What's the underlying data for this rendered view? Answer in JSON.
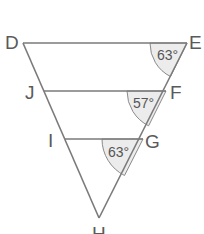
{
  "diagram": {
    "type": "geometry-figure",
    "colors": {
      "line": "#7a7a7a",
      "label": "#5a5a5a",
      "angle_fill": "#ececec"
    },
    "vertices": [
      {
        "name": "D",
        "label": "D"
      },
      {
        "name": "E",
        "label": "E"
      },
      {
        "name": "J",
        "label": "J"
      },
      {
        "name": "F",
        "label": "F"
      },
      {
        "name": "I",
        "label": "I"
      },
      {
        "name": "G",
        "label": "G"
      },
      {
        "name": "H",
        "label": "H"
      }
    ],
    "segments": [
      "DE",
      "JF",
      "IG",
      "DH",
      "EH"
    ],
    "angles": [
      {
        "at": "E",
        "between": "DE and EF",
        "value": "63°"
      },
      {
        "at": "F",
        "between": "JF and FG",
        "value": "57°"
      },
      {
        "at": "G",
        "between": "IG and GH",
        "value": "63°"
      }
    ],
    "top_partial_glyph": "y"
  }
}
